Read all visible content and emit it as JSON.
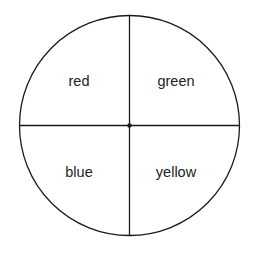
{
  "diagram": {
    "type": "circle-quadrants",
    "colors": {
      "stroke": "#1a1a1a",
      "text": "#222222",
      "background": "#ffffff"
    },
    "circle": {
      "cx": 129.5,
      "cy": 125.5,
      "r": 110
    },
    "quadrants": [
      {
        "position": "top-left",
        "label": "red",
        "x": 79,
        "y": 86
      },
      {
        "position": "top-right",
        "label": "green",
        "x": 176,
        "y": 86
      },
      {
        "position": "bottom-left",
        "label": "blue",
        "x": 79,
        "y": 177
      },
      {
        "position": "bottom-right",
        "label": "yellow",
        "x": 176,
        "y": 177
      }
    ]
  }
}
